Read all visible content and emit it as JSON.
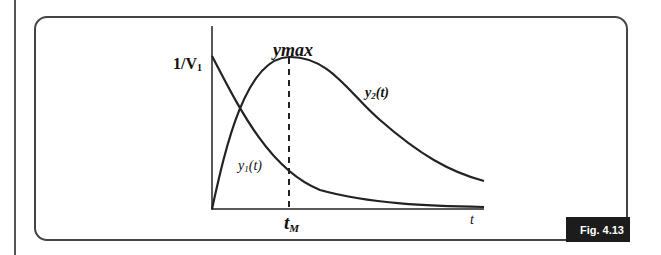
{
  "figure": {
    "caption_badge": "Fig. 4.13",
    "y_axis_label": "1/V",
    "y_axis_label_sub": "1",
    "peak_label": "ymax",
    "x_peak_label": "t",
    "x_peak_label_sub": "M",
    "x_axis_label": "t",
    "curve1_label": "y",
    "curve1_sub": "1",
    "curve1_arg": "(t)",
    "curve2_label": "y",
    "curve2_sub": "2",
    "curve2_arg": "(t)"
  },
  "colors": {
    "line": "#222222",
    "frame": "#444444",
    "badge_bg": "#1c1c1c",
    "badge_text": "#ffffff"
  }
}
